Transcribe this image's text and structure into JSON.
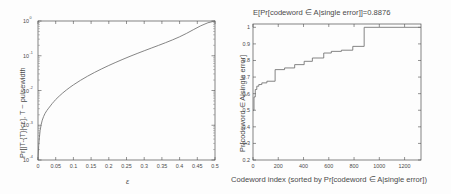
{
  "figure": {
    "background_color": "#fdfdfd",
    "curve_color": "#6f6f6f",
    "axis_color": "#4d4d4d",
    "text_color": "#4a4a4a"
  },
  "chart_data": [
    {
      "type": "line",
      "panel": "left",
      "title": "",
      "xlabel": "ε",
      "ylabel": "Pr[|T-{T}|<ε], T ~ pulsewidth",
      "xscale": "linear",
      "yscale": "log",
      "xlim": [
        0,
        0.5
      ],
      "ylim": [
        0.0001,
        1
      ],
      "grid": false,
      "legend": null,
      "xticks": [
        0,
        0.05,
        0.1,
        0.15,
        0.2,
        0.25,
        0.3,
        0.35,
        0.4,
        0.45,
        0.5
      ],
      "xticklabels": [
        "0",
        "0.05",
        "0.1",
        "0.15",
        "0.2",
        "0.25",
        "0.3",
        "0.35",
        "0.4",
        "0.45",
        "0.5"
      ],
      "yticks": [
        0.0001,
        0.001,
        0.01,
        0.1,
        1
      ],
      "yticklabels": [
        "10-4",
        "10-3",
        "10-2",
        "10-1",
        "100"
      ],
      "ytick_mantissa": "10",
      "ytick_exponents": [
        "-4",
        "-3",
        "-2",
        "-1",
        "0"
      ],
      "x": [
        0.0,
        0.002,
        0.004,
        0.006,
        0.009,
        0.012,
        0.016,
        0.02,
        0.025,
        0.03,
        0.035,
        0.04,
        0.045,
        0.05,
        0.06,
        0.07,
        0.08,
        0.09,
        0.1,
        0.12,
        0.14,
        0.16,
        0.18,
        0.2,
        0.22,
        0.24,
        0.26,
        0.28,
        0.3,
        0.32,
        0.34,
        0.36,
        0.38,
        0.4,
        0.42,
        0.44,
        0.46,
        0.48,
        0.5
      ],
      "y": [
        0.0001,
        0.00026,
        0.00045,
        0.0007,
        0.00105,
        0.0014,
        0.0018,
        0.0022,
        0.00265,
        0.0031,
        0.0036,
        0.0042,
        0.0048,
        0.0055,
        0.0069,
        0.0085,
        0.0103,
        0.0123,
        0.0145,
        0.0196,
        0.0258,
        0.0332,
        0.042,
        0.0525,
        0.0648,
        0.0793,
        0.0963,
        0.116,
        0.139,
        0.166,
        0.198,
        0.237,
        0.286,
        0.351,
        0.442,
        0.57,
        0.73,
        0.89,
        1.0
      ]
    },
    {
      "type": "line",
      "panel": "right",
      "title": "E[Pr[codeword ∈ A|single error]]=0.8876",
      "xlabel": "Codeword index (sorted by Pr[codeword ∈ A|single error])",
      "ylabel": "Pr[codeword ∈ A|single error]",
      "xscale": "linear",
      "yscale": "linear",
      "xlim": [
        0,
        1330
      ],
      "ylim": [
        0.2,
        1.02
      ],
      "grid": false,
      "legend": null,
      "drawstyle": "steps-post",
      "xticks": [
        0,
        200,
        400,
        600,
        800,
        1000,
        1200
      ],
      "xticklabels": [
        "0",
        "200",
        "400",
        "600",
        "800",
        "1000",
        "1200"
      ],
      "yticks": [
        0.2,
        0.3,
        0.4,
        0.5,
        0.6,
        0.7,
        0.8,
        0.9,
        1
      ],
      "yticklabels": [
        "0.2",
        "0.3",
        "0.4",
        "0.5",
        "0.6",
        "0.7",
        "0.8",
        "0.9",
        "1"
      ],
      "mean_value": 0.8876,
      "x": [
        0,
        8,
        18,
        30,
        46,
        70,
        110,
        175,
        250,
        330,
        405,
        470,
        560,
        620,
        700,
        790,
        880,
        1330
      ],
      "y": [
        0.5,
        0.58,
        0.625,
        0.645,
        0.655,
        0.665,
        0.675,
        0.745,
        0.755,
        0.775,
        0.795,
        0.815,
        0.845,
        0.855,
        0.862,
        0.885,
        1.0,
        1.0
      ]
    }
  ],
  "left_panel": {
    "ylabel": "Pr[|T-{T}|<ε], T ~ pulsewidth",
    "xlabel": "ε"
  },
  "right_panel": {
    "title": "E[Pr[codeword ∈ A|single error]]=0.8876",
    "ylabel": "Pr[codeword ∈ A|single error]",
    "xlabel": "Codeword index (sorted by Pr[codeword ∈ A|single error])"
  }
}
